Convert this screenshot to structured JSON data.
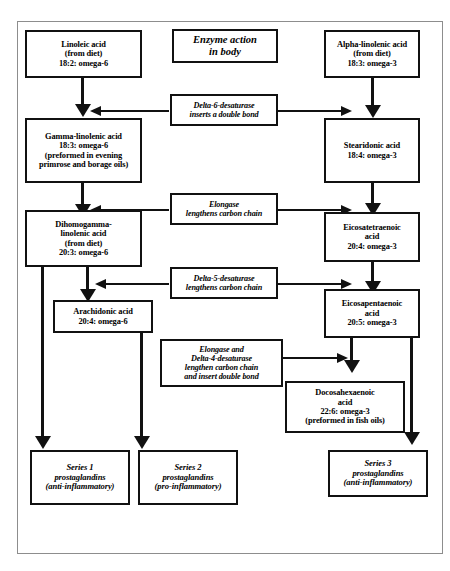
{
  "diagram": {
    "title_box": {
      "text": "Enzyme action\nin body"
    },
    "substrates": [
      {
        "id": "linoleic",
        "text": "Linoleic acid\n(from diet)\n18:2: omega-6"
      },
      {
        "id": "alpha-linolenic",
        "text": "Alpha-linolenic acid\n(from diet)\n18:3: omega-3"
      },
      {
        "id": "gamma-linolenic",
        "text": "Gamma-linolenic acid\n18:3: omega-6\n(preformed in evening\nprimrose and borage oils)"
      },
      {
        "id": "stearidonic",
        "text": "Stearidonic acid\n18:4: omega-3"
      },
      {
        "id": "dihomogamma-linolenic",
        "text": "Dihomogamma-\nlinolenic acid\n(from diet)\n20:3: omega-6"
      },
      {
        "id": "eicosatetraenoic",
        "text": "Eicosatetraenoic\nacid\n20:4: omega-3"
      },
      {
        "id": "arachidonic",
        "text": "Arachidonic acid\n20:4: omega-6"
      },
      {
        "id": "eicosapentaenoic",
        "text": "Eicosapentaenoic\nacid\n20:5: omega-3"
      },
      {
        "id": "docosahexaenoic",
        "text": "Docosahexaenoic\nacid\n22:6: omega-3\n(preformed in fish oils)"
      }
    ],
    "enzymes": [
      {
        "id": "delta-6-desaturase",
        "text": "Delta-6-desaturase\ninserts a double bond"
      },
      {
        "id": "elongase",
        "text": "Elongase\nlengthens carbon chain"
      },
      {
        "id": "delta-5-desaturase",
        "text": "Delta-5-desaturase\nlengthens carbon chain"
      },
      {
        "id": "elongase-delta-4-desaturase",
        "text": "Elongase and\nDelta-4-desaturase\nlengthen carbon chain\nand insert double bond"
      }
    ],
    "products": [
      {
        "id": "series-1",
        "text": "Series 1\nprostaglandins\n(anti-inflammatory)"
      },
      {
        "id": "series-2",
        "text": "Series 2\nprostaglandins\n(pro-inflammatory)"
      },
      {
        "id": "series-3",
        "text": "Series 3\nprostaglandins\n(anti-inflammatory)"
      }
    ],
    "colors": {
      "line": "#111111",
      "box_border": "#111111",
      "frame_border": "#8d8d8d",
      "background": "#ffffff",
      "text": "#000000"
    }
  }
}
